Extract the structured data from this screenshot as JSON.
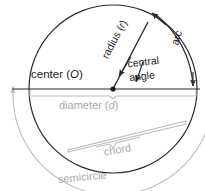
{
  "figure": {
    "background_color": "#ffffff",
    "dark_stroke_color": "#2b2b2b",
    "gray_stroke_color": "#bdbdbd",
    "dark_text_color": "#1a1a1a",
    "gray_text_color": "#a8a8a8"
  },
  "labels": {
    "center": "center (",
    "center_symbol": "O",
    "center_close": ")",
    "radius": "radius (",
    "radius_symbol": "r",
    "radius_close": ")",
    "central_angle_line1": "central",
    "central_angle_line2": "angle",
    "arc": "arc",
    "diameter": "diameter (",
    "diameter_symbol": "d",
    "diameter_close": ")",
    "chord": "chord",
    "semicircle": "semicircle"
  },
  "geometry": {
    "circle_center_x": 113,
    "circle_center_y": 89,
    "circle_radius": 84,
    "diameter_y": 89,
    "diameter_left_x": 12,
    "diameter_right_x": 200,
    "radius_endpoint_x": 148,
    "radius_endpoint_y": 22,
    "center_dot_radius": 2.6,
    "arc_offset": 14,
    "semicircle_offset": 16,
    "chord_start_x": 68,
    "chord_start_y": 152,
    "chord_end_x": 186,
    "chord_end_y": 124
  }
}
